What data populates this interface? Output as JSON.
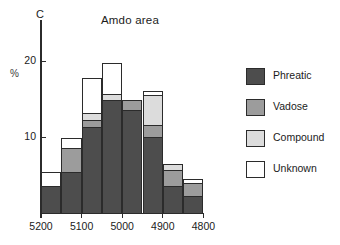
{
  "chart_data": {
    "type": "bar",
    "title": "Amdo area",
    "corner_label": "C",
    "xlabel": "",
    "ylabel": "%",
    "stacked": true,
    "grid": false,
    "legend_position": "right",
    "ylim": [
      0,
      22.5
    ],
    "yticks": [
      10,
      20
    ],
    "ytick_labels": [
      "10",
      "20"
    ],
    "xtick_labels": [
      "5200",
      "5100",
      "5000",
      "4900",
      "4800"
    ],
    "xtick_values": [
      5200,
      5100,
      5000,
      4900,
      4800
    ],
    "categories": [
      "5200-5150",
      "5150-5100",
      "5100-5050",
      "5050-5000",
      "5000-4950",
      "4950-4900",
      "4900-4850",
      "4850-4800"
    ],
    "series": [
      {
        "name": "Phreatic",
        "color": "#4d4d4d",
        "values": [
          3.6,
          5.4,
          11.3,
          14.9,
          13.6,
          10.0,
          3.6,
          2.2
        ]
      },
      {
        "name": "Vadose",
        "color": "#9c9c9c",
        "values": [
          0.0,
          3.2,
          1.0,
          0.0,
          1.3,
          1.6,
          2.1,
          1.8
        ]
      },
      {
        "name": "Compound",
        "color": "#dcdcdc",
        "values": [
          0.0,
          0.0,
          0.9,
          0.7,
          0.0,
          3.9,
          0.8,
          0.0
        ]
      },
      {
        "name": "Unknown",
        "color": "#ffffff",
        "values": [
          1.8,
          1.3,
          4.5,
          4.1,
          0.0,
          0.5,
          0.0,
          0.5
        ]
      }
    ],
    "totals": [
      5.4,
      9.9,
      17.7,
      19.7,
      14.9,
      16.0,
      6.5,
      4.5
    ]
  },
  "legend": {
    "items": [
      {
        "label": "Phreatic",
        "color": "#4d4d4d"
      },
      {
        "label": "Vadose",
        "color": "#9c9c9c"
      },
      {
        "label": "Compound",
        "color": "#dcdcdc"
      },
      {
        "label": "Unknown",
        "color": "#ffffff"
      }
    ]
  }
}
